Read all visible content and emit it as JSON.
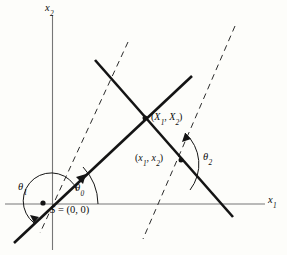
{
  "figure": {
    "background_color": "#fdfdfa",
    "line_color": "#141414",
    "axis_color": "#767676",
    "width": 287,
    "height": 255
  },
  "axes": {
    "vertical": {
      "label_base": "x",
      "label_sub": "2",
      "x": 52.5,
      "y_top": 15,
      "y_bottom": 250
    },
    "horizontal": {
      "label_base": "x",
      "label_sub": "1",
      "y": 204,
      "x_left": 5,
      "x_right": 265
    }
  },
  "origin": {
    "label_prefix": "S",
    "label_equals": " = ",
    "label_value": "(0, 0)",
    "full_label": "S = (0, 0)",
    "x": 43,
    "y": 203
  },
  "points": [
    {
      "name": "capital-point",
      "label_open": "(",
      "label_first_base": "X",
      "label_first_sub": "1",
      "label_comma": ", ",
      "label_second_base": "X",
      "label_second_sub": "2",
      "label_close": ")",
      "full_label": "(X1, X2)",
      "x": 145,
      "y": 118
    },
    {
      "name": "lowercase-point",
      "label_open": "(",
      "label_first_base": "x",
      "label_first_sub": "1",
      "label_comma": ", ",
      "label_second_base": "x",
      "label_second_sub": "2",
      "label_close": ")",
      "full_label": "(x1, x2)",
      "x": 181,
      "y": 160
    }
  ],
  "angles": [
    {
      "name": "theta-zero",
      "base": "θ",
      "sub": "0",
      "full_label": "θ0",
      "description": "angle from positive x1 axis to solid ray through origin"
    },
    {
      "name": "theta-one",
      "base": "θ",
      "sub": "1",
      "full_label": "θ1",
      "description": "reflex angle from positive x1 axis counterclockwise to lower-left ray"
    },
    {
      "name": "theta-two",
      "base": "θ",
      "sub": "2",
      "full_label": "θ2",
      "description": "angle between descending solid line and right dashed line"
    }
  ],
  "lines": {
    "solid": [
      {
        "name": "ascending-solid-line",
        "x1": 14,
        "y1": 243,
        "x2": 192,
        "y2": 76,
        "note": "passes through origin S and capital point"
      },
      {
        "name": "descending-solid-line",
        "x1": 95,
        "y1": 60,
        "x2": 233,
        "y2": 217,
        "note": "passes through capital point and lowercase point"
      }
    ],
    "dashed": [
      {
        "name": "left-dashed-line",
        "x1": 128,
        "y1": 42,
        "x2": 40,
        "y2": 233
      },
      {
        "name": "right-dashed-line",
        "x1": 235,
        "y1": 26,
        "x2": 143,
        "y2": 239
      }
    ]
  }
}
